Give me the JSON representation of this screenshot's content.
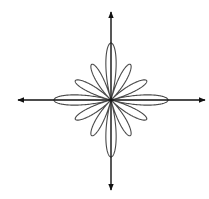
{
  "chart_data": {
    "type": "polar-curve",
    "title": "",
    "equation_model": "r = |cos(6θ)| · (a + b·cos²(2θ))",
    "params": {
      "a": 34.3,
      "b": 22.7
    },
    "petals": [
      {
        "angle_deg": 0,
        "length": 57
      },
      {
        "angle_deg": 30,
        "length": 40
      },
      {
        "angle_deg": 60,
        "length": 40
      },
      {
        "angle_deg": 90,
        "length": 57
      },
      {
        "angle_deg": 120,
        "length": 40
      },
      {
        "angle_deg": 150,
        "length": 40
      },
      {
        "angle_deg": 180,
        "length": 57
      },
      {
        "angle_deg": 210,
        "length": 40
      },
      {
        "angle_deg": 240,
        "length": 40
      },
      {
        "angle_deg": 270,
        "length": 57
      },
      {
        "angle_deg": 300,
        "length": 40
      },
      {
        "angle_deg": 330,
        "length": 40
      }
    ],
    "axes": {
      "center": [
        111,
        100
      ],
      "x_axis": {
        "from": 18,
        "to": 205,
        "arrows": "both",
        "label": ""
      },
      "y_axis": {
        "from": 12,
        "to": 190,
        "arrows": "both",
        "label": ""
      },
      "ticks": []
    },
    "colors": {
      "curve": "#4a4a4a",
      "axes": "#111111",
      "background": "#ffffff"
    }
  }
}
